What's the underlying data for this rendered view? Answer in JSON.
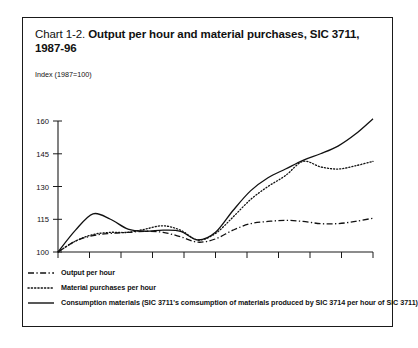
{
  "chart_data": {
    "type": "line",
    "title": "Chart 1-2. Output per hour and material purchases, SIC 3711, 1987-96",
    "title_lead": "Chart 1-2.",
    "title_strong": "Output per hour and material purchases, SIC 3711, 1987-96",
    "subtitle": "Index (1987=100)",
    "xlabel": "",
    "ylabel": "Index (1987=100)",
    "ylim": [
      100,
      165
    ],
    "xlim": [
      1987,
      1996
    ],
    "grid": false,
    "legend_position": "below",
    "ytick_labels": [
      "100",
      "115",
      "130",
      "145",
      "160"
    ],
    "ytick_values": [
      100,
      115,
      130,
      145,
      160
    ],
    "xtick_labels": [
      "1987",
      "1989",
      "1991",
      "1993",
      "1995"
    ],
    "xtick_values": [
      1987,
      1989,
      1991,
      1993,
      1995
    ],
    "x": [
      1987,
      1987.5,
      1988,
      1988.5,
      1989,
      1989.5,
      1990,
      1990.5,
      1991,
      1991.5,
      1992,
      1992.5,
      1993,
      1993.5,
      1994,
      1994.5,
      1995,
      1995.5,
      1996
    ],
    "series": [
      {
        "name": "Output per hour",
        "style": "dash-dot",
        "values": [
          100,
          105,
          107.5,
          108.5,
          109,
          109.5,
          109,
          107,
          104.5,
          106,
          110,
          113,
          114,
          114.5,
          114,
          113,
          113,
          114,
          115.5
        ]
      },
      {
        "name": "Material purchases per hour",
        "style": "dotted",
        "values": [
          100,
          105,
          108,
          109,
          109,
          110.5,
          112,
          110,
          105.5,
          108.5,
          116,
          124,
          130,
          135,
          141.5,
          139,
          138,
          139.5,
          141.5
        ]
      },
      {
        "name": "Consumption materials (SIC 3711's comsumption of materials produced by SIC 3714 per hour of SIC 3711)",
        "style": "solid",
        "values": [
          100,
          110,
          117.5,
          115,
          110.5,
          109.5,
          110,
          109.5,
          105.5,
          109,
          119,
          128,
          134,
          138,
          142,
          145,
          148.5,
          154,
          161
        ]
      }
    ]
  },
  "legend": {
    "items": [
      {
        "label": "Output per hour",
        "style": "dash-dot"
      },
      {
        "label": "Material purchases per hour",
        "style": "dotted"
      },
      {
        "label": "Consumption materials (SIC 3711's comsumption of materials produced by SIC 3714 per hour of SIC 3711)",
        "style": "solid"
      }
    ]
  }
}
